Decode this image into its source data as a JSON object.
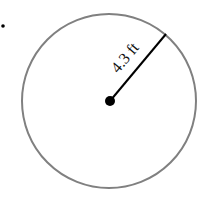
{
  "figure": {
    "marker": "•",
    "radius_label": "4.3 ft",
    "colors": {
      "circle": "#808080",
      "radius": "#000000"
    }
  }
}
